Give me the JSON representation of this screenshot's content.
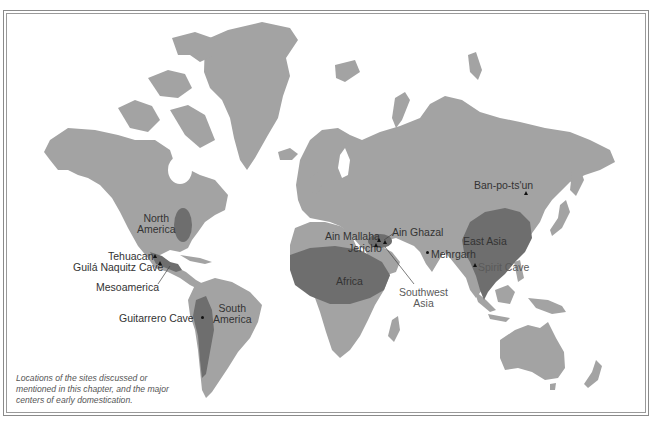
{
  "map": {
    "type": "world-map",
    "colors": {
      "background": "#ffffff",
      "land": "#a3a3a3",
      "domestication_center": "#6e6e6e",
      "border": "#8a8a8a",
      "label_text": "#333333"
    }
  },
  "regions": {
    "north_america": "North\nAmerica",
    "north_america_line1": "North",
    "north_america_line2": "America",
    "mesoamerica": "Mesoamerica",
    "south_america_line1": "South",
    "south_america_line2": "America",
    "africa": "Africa",
    "southwest_asia_line1": "Southwest",
    "southwest_asia_line2": "Asia",
    "east_asia": "East Asia"
  },
  "sites": {
    "tehuacan": "Tehuacan",
    "guila_naquitz": "Guilá Naquitz Cave",
    "guitarrero": "Guitarrero Cave",
    "ain_mallaha": "Ain Mallaha",
    "ain_ghazal": "Ain Ghazal",
    "jericho": "Jericho",
    "mehrgarh": "Mehrgarh",
    "spirit_cave": "Spirit Cave",
    "ban_po_ts_un": "Ban-po-ts'un"
  },
  "caption": {
    "line1": "Locations of the sites discussed or",
    "line2": "mentioned in this chapter, and the major",
    "line3": "centers of early domestication."
  }
}
